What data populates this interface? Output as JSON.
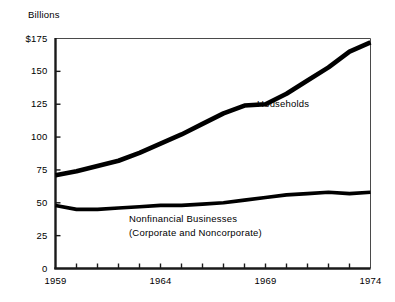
{
  "chart_data": {
    "type": "line",
    "title": "",
    "subtitle": "",
    "unit_label": "Billions",
    "xlabel": "",
    "ylabel": "",
    "xlim": [
      1959,
      1974
    ],
    "ylim": [
      0,
      175
    ],
    "grid": false,
    "legend_position": "inline-annotations",
    "y_ticks": [
      {
        "value": 175,
        "label": "$175"
      },
      {
        "value": 150,
        "label": "150"
      },
      {
        "value": 125,
        "label": "125"
      },
      {
        "value": 100,
        "label": "100"
      },
      {
        "value": 75,
        "label": "75"
      },
      {
        "value": 50,
        "label": "50"
      },
      {
        "value": 25,
        "label": "25"
      },
      {
        "value": 0,
        "label": "0"
      }
    ],
    "x_ticks": [
      1959,
      1960,
      1961,
      1962,
      1963,
      1964,
      1965,
      1966,
      1967,
      1968,
      1969,
      1970,
      1971,
      1972,
      1973,
      1974
    ],
    "x_tick_labels": [
      {
        "value": 1959,
        "label": "1959"
      },
      {
        "value": 1964,
        "label": "1964"
      },
      {
        "value": 1969,
        "label": "1969"
      },
      {
        "value": 1974,
        "label": "1974"
      }
    ],
    "x": [
      1959,
      1960,
      1961,
      1962,
      1963,
      1964,
      1965,
      1966,
      1967,
      1968,
      1969,
      1970,
      1971,
      1972,
      1973,
      1974
    ],
    "series": [
      {
        "name": "Households",
        "color": "#000000",
        "annotation": "Households",
        "values": [
          71,
          74,
          78,
          82,
          88,
          95,
          102,
          110,
          118,
          124,
          125,
          133,
          143,
          153,
          165,
          172
        ]
      },
      {
        "name": "Nonfinancial Businesses (Corporate and Noncorporate)",
        "color": "#000000",
        "annotation_line1": "Nonfinancial Businesses",
        "annotation_line2": "(Corporate and Noncorporate)",
        "values": [
          48,
          45,
          45,
          46,
          47,
          48,
          48,
          49,
          50,
          52,
          54,
          56,
          57,
          58,
          57,
          58
        ]
      }
    ]
  },
  "annotations": {
    "households": "Households",
    "business_line1": "Nonfinancial Businesses",
    "business_line2": "(Corporate and Noncorporate)"
  },
  "colors": {
    "line": "#000000",
    "frame": "#4a4a4a",
    "axis": "#1a1a1a",
    "background": "#ffffff"
  }
}
